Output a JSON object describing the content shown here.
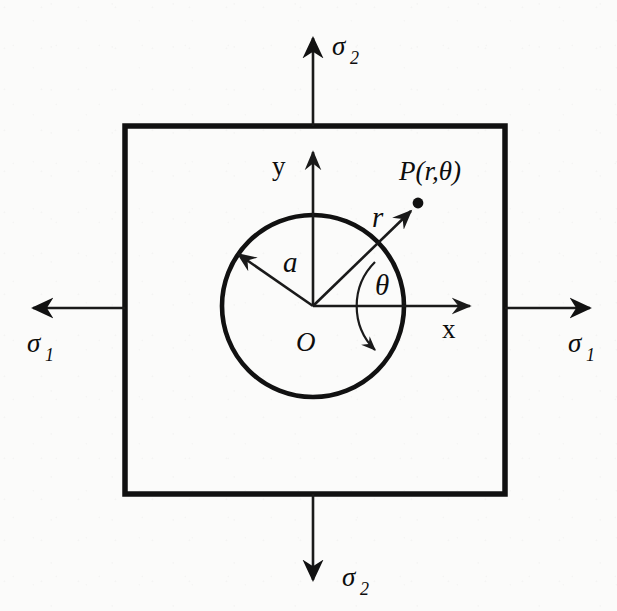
{
  "labels": {
    "stress_top": {
      "symbol": "σ",
      "subscript": "2",
      "icon": "arrow-up-icon"
    },
    "stress_bottom": {
      "symbol": "σ",
      "subscript": "2",
      "icon": "arrow-down-icon"
    },
    "stress_left": {
      "symbol": "σ",
      "subscript": "1",
      "icon": "arrow-left-icon"
    },
    "stress_right": {
      "symbol": "σ",
      "subscript": "1",
      "icon": "arrow-right-icon"
    },
    "axis_x": "x",
    "axis_y": "y",
    "origin": "O",
    "radius_hole": "a",
    "radius_point": "r",
    "angle": "θ",
    "point": "P(r,θ)"
  },
  "geometry": {
    "plate": {
      "left": 125,
      "top": 126,
      "right": 505,
      "bottom": 494
    },
    "hole": {
      "center_x": 313,
      "center_y": 306,
      "radius": 91
    },
    "origin_point": {
      "x": 313,
      "y": 306
    },
    "point_P": {
      "x": 417,
      "y": 205
    },
    "angle_theta_degrees": 45,
    "angle_a_degrees": 145,
    "theta_arc_radius": 62
  },
  "colors": {
    "background": "#fbfbfa",
    "ink": "#111111",
    "line": "#1a1a1a"
  }
}
